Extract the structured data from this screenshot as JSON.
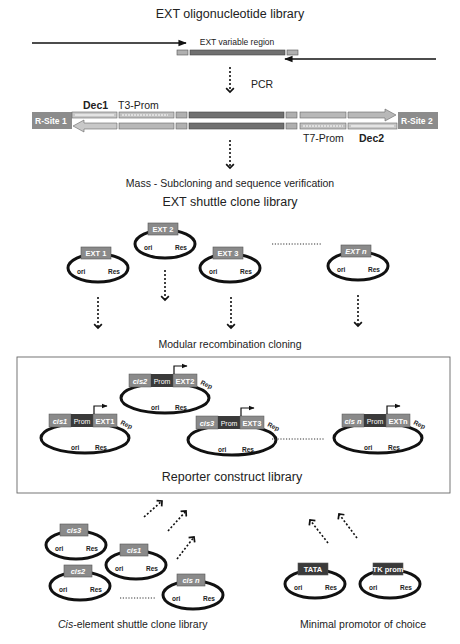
{
  "titles": {
    "oligo_library": "EXT oligonucleotide library",
    "variable_region": "EXT variable region",
    "pcr": "PCR",
    "subcloning": "Mass - Subcloning and sequence verification",
    "shuttle_library": "EXT shuttle clone library",
    "modular_cloning": "Modular recombination cloning",
    "reporter_library": "Reporter construct library",
    "cis_library_italic": "Cis",
    "cis_library_rest": "-element shuttle clone library",
    "minimal_promoter": "Minimal promotor of choice"
  },
  "construct": {
    "rsite1": "R-Site 1",
    "rsite2": "R-Site 2",
    "dec1": "Dec1",
    "dec2": "Dec2",
    "t3": "T3-Prom",
    "t7": "T7-Prom"
  },
  "plasmid_labels": {
    "ori": "ori",
    "res": "Res",
    "rep": "Rep",
    "prom": "Prom"
  },
  "ext_clones": [
    "EXT 1",
    "EXT 2",
    "EXT 3",
    "EXT n"
  ],
  "reporters": [
    {
      "cis": "cis1",
      "ext": "EXT1"
    },
    {
      "cis": "cis2",
      "ext": "EXT2"
    },
    {
      "cis": "cis3",
      "ext": "EXT3"
    },
    {
      "cis": "cis n",
      "ext": "EXTn"
    }
  ],
  "cis_clones": [
    "cis3",
    "cis1",
    "cis2",
    "cis n"
  ],
  "promoters": [
    "TATA",
    "TK prom"
  ],
  "colors": {
    "ext_box": "#8a8a8a",
    "dark_box": "#3a3a3a",
    "variable": "#707070",
    "light": "#b8b8b8",
    "rsite": "#8c8c8c"
  }
}
